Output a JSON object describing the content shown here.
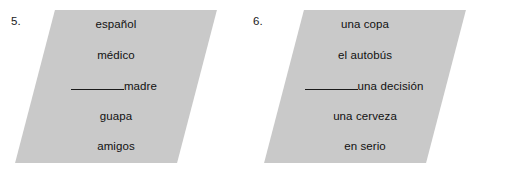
{
  "page": {
    "background_color": "#ffffff",
    "panel_color": "#c9c9c9",
    "text_color": "#111111"
  },
  "exercises": [
    {
      "number": "5.",
      "lines": [
        {
          "blank": false,
          "text": "español"
        },
        {
          "blank": false,
          "text": "médico"
        },
        {
          "blank": true,
          "text": "madre"
        },
        {
          "blank": false,
          "text": "guapa"
        },
        {
          "blank": false,
          "text": "amigos"
        }
      ]
    },
    {
      "number": "6.",
      "lines": [
        {
          "blank": false,
          "text": "una copa"
        },
        {
          "blank": false,
          "text": "el autobús"
        },
        {
          "blank": true,
          "text": "una decisión"
        },
        {
          "blank": false,
          "text": "una cerveza"
        },
        {
          "blank": false,
          "text": "en serio"
        }
      ]
    }
  ]
}
